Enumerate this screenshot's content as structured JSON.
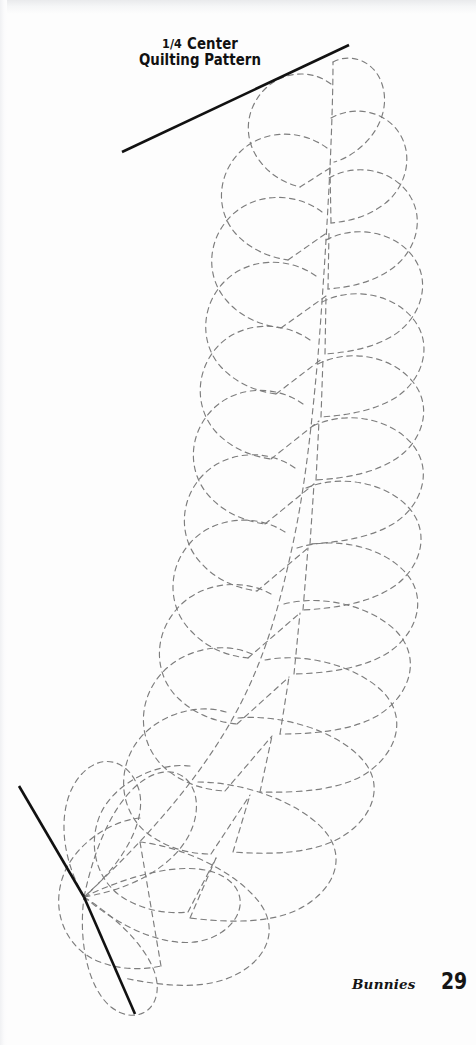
{
  "page": {
    "width": 476,
    "height": 1045,
    "background_color": "#fdfdfd",
    "kind": "scanned-book-page"
  },
  "title": {
    "line1_fraction": "1/4",
    "line1_word": "Center",
    "line2": "Quilting Pattern",
    "full_text": "1/4 Center Quilting Pattern",
    "color": "#111111"
  },
  "footer": {
    "chapter": "Bunnies",
    "page_number": "29",
    "color": "#151515"
  },
  "artwork": {
    "name": "feather-plume-quilting-motif",
    "description": "Dashed feather plume motif radiating from a corner origin, bounded by two solid black guide lines forming a quarter-block corner.",
    "dash_color": "#7d7d7d",
    "dash_width": 1.15,
    "dash_pattern": "5.5 4.5",
    "solid_line_color": "#111111",
    "solid_line_width": 2.6,
    "origin_point": [
      84,
      897
    ],
    "guide_lines": [
      {
        "name": "top-guide-line",
        "x1": 122,
        "y1": 152,
        "x2": 349,
        "y2": 45
      },
      {
        "name": "bottom-guide-line",
        "x1": 84,
        "y1": 897,
        "x2": 135,
        "y2": 1014
      },
      {
        "name": "upper-left-guide-line",
        "x1": 19,
        "y1": 786,
        "x2": 84,
        "y2": 897
      }
    ],
    "spine": {
      "name": "feather-spine",
      "path": "M 84 897 C 140 845 190 790 226 730 C 262 670 278 612 292 548 C 306 484 312 420 318 356 C 323 292 327 228 330 168 C 332 122 333 88 333 62"
    },
    "plume_counts": {
      "right_side": 14,
      "left_side": 13
    }
  }
}
